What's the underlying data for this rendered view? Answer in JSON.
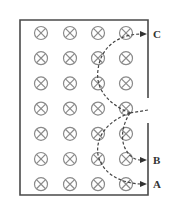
{
  "diagram": {
    "field_symbol": "into-page (⊗)",
    "grid": {
      "columns": 4,
      "rows": 7
    },
    "entry_point": "gap in right wall",
    "labels": {
      "a": "A",
      "b": "B",
      "c": "C"
    },
    "colors": {
      "frame": "#4a4a4a",
      "symbol": "#8a8a8a",
      "path": "#444444"
    }
  }
}
